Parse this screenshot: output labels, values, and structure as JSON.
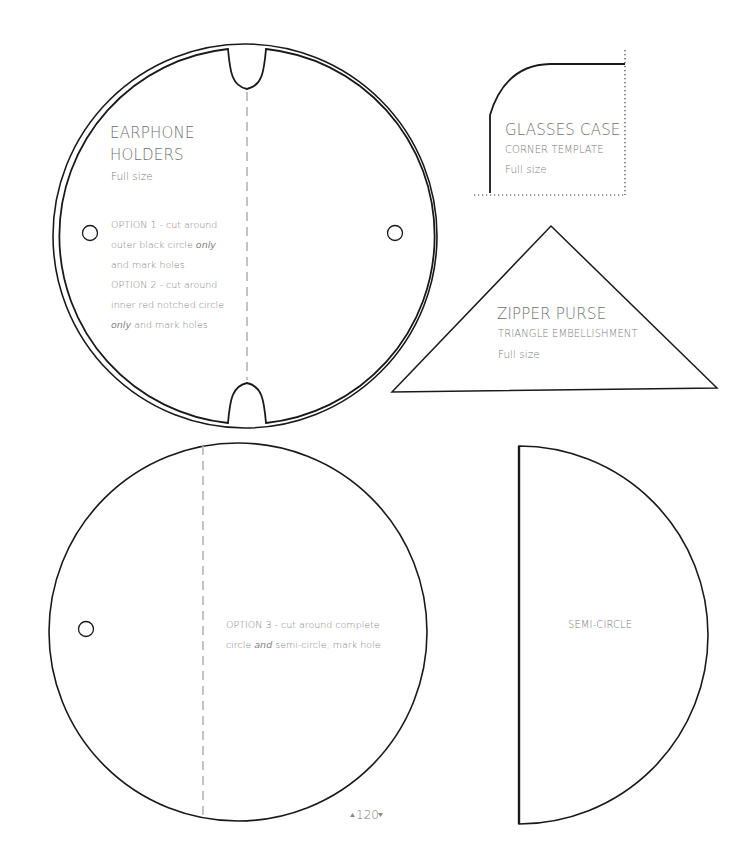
{
  "earphone": {
    "title_line1": "EARPHONE",
    "title_line2": "HOLDERS",
    "size": "Full size",
    "option1_a": "OPTION 1 - cut around",
    "option1_b": "outer black circle ",
    "option1_b_em": "only",
    "option1_c": "and mark holes",
    "option2_a": "OPTION 2 - cut around",
    "option2_b": "inner red notched circle",
    "option2_c_em": "only",
    "option2_c": " and mark holes"
  },
  "glasses": {
    "title": "GLASSES CASE",
    "subtitle": "CORNER TEMPLATE",
    "size": "Full size"
  },
  "zipper": {
    "title": "ZIPPER PURSE",
    "subtitle": "TRIANGLE EMBELLISHMENT",
    "size": "Full size"
  },
  "option3": {
    "line1": "OPTION 3 - cut around complete",
    "line2_a": "circle ",
    "line2_em": "and",
    "line2_b": " semi-circle; mark hole"
  },
  "semicircle": {
    "label": "SEMI-CIRCLE"
  },
  "page_number": "120",
  "colors": {
    "stroke": "#1a1a1a",
    "dash": "#b5b5b5",
    "text": "#707070"
  }
}
